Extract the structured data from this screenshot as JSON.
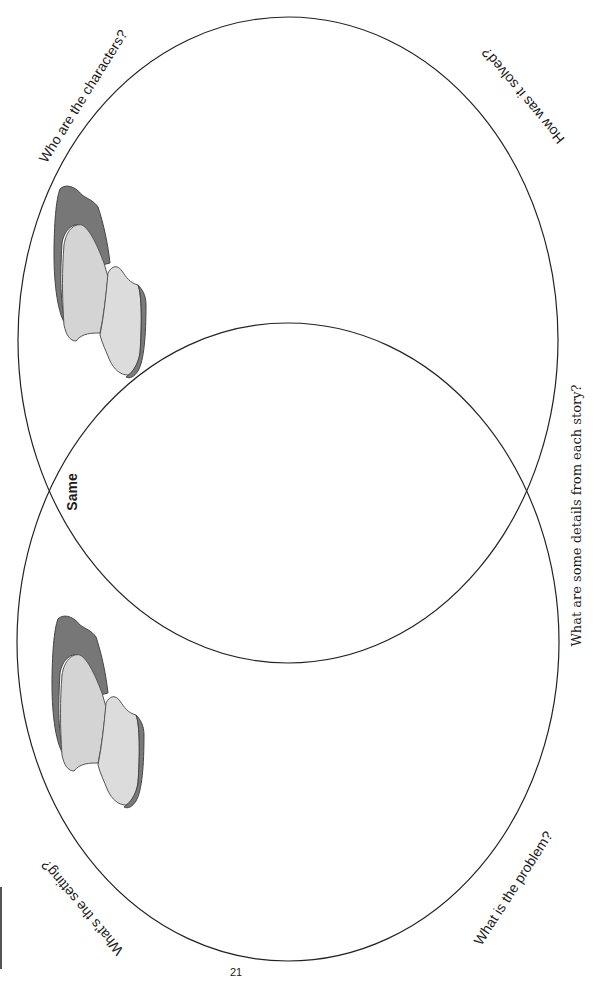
{
  "diagram": {
    "type": "venn",
    "circles": [
      {
        "id": "story-top",
        "prompts": [
          "Who are the characters?",
          "How was it solved?"
        ]
      },
      {
        "id": "story-bottom",
        "prompts": [
          "What's the setting?",
          "What is the problem?"
        ]
      }
    ],
    "overlap_label": "Same",
    "side_prompt": "What are some details from each story?",
    "icons": [
      "book-icon",
      "book-icon"
    ]
  },
  "labels": {
    "characters": "Who are the characters?",
    "solved": "How was it solved?",
    "setting": "What's the setting?",
    "problem": "What is the problem?",
    "same": "Same",
    "details": "What are some details from each story?"
  },
  "footer": {
    "page_number": "21"
  },
  "colors": {
    "line": "#222222",
    "book_dark": "#6e6e6e",
    "book_light": "#d6d6d6"
  }
}
